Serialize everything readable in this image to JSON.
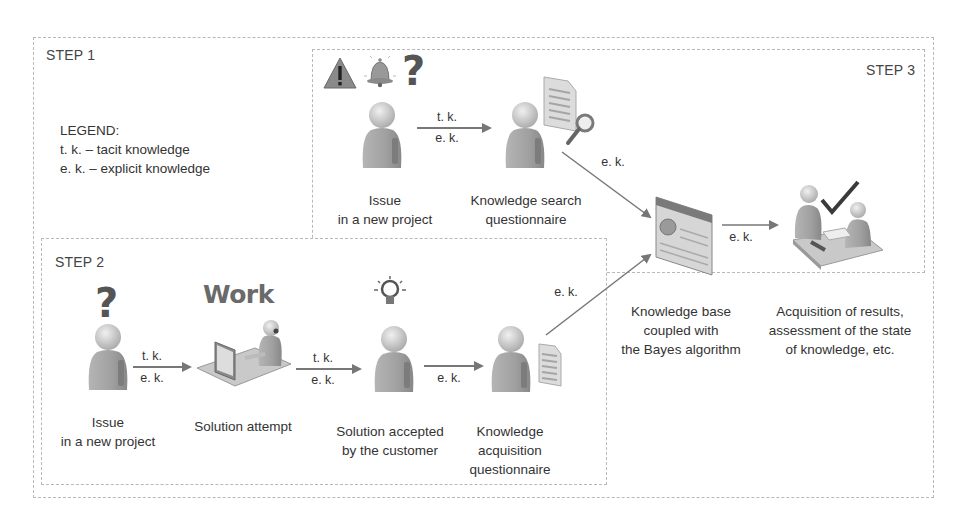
{
  "steps": {
    "step1": {
      "label": "STEP 1"
    },
    "step2": {
      "label": "STEP 2"
    },
    "step3": {
      "label": "STEP 3"
    }
  },
  "legend": {
    "title": "LEGEND:",
    "items": [
      "t. k. – tacit knowledge",
      "e. k. – explicit knowledge"
    ]
  },
  "step3_nodes": [
    {
      "id": "issue",
      "caption_lines": [
        "Issue",
        "in a new project"
      ],
      "icons": [
        "warning-icon",
        "bell-icon",
        "question-icon",
        "person-icon"
      ]
    },
    {
      "id": "search_questionnaire",
      "caption_lines": [
        "Knowledge search",
        "questionnaire"
      ],
      "icons": [
        "person-icon",
        "document-icon",
        "magnifier-icon"
      ]
    },
    {
      "id": "knowledge_base",
      "caption_lines": [
        "Knowledge base",
        "coupled with",
        "the Bayes algorithm"
      ],
      "icons": [
        "database-panel-icon"
      ]
    },
    {
      "id": "results",
      "caption_lines": [
        "Acquisition of results,",
        "assessment of the state",
        "of knowledge, etc."
      ],
      "icons": [
        "meeting-icon",
        "checkmark-icon"
      ]
    }
  ],
  "step2_nodes": [
    {
      "id": "issue2",
      "caption_lines": [
        "Issue",
        "in a new project"
      ],
      "icons": [
        "question-icon",
        "person-icon"
      ]
    },
    {
      "id": "solution_attempt",
      "caption_lines": [
        "Solution attempt"
      ],
      "heading": "Work",
      "icons": [
        "workstation-icon"
      ]
    },
    {
      "id": "solution_accepted",
      "caption_lines": [
        "Solution accepted",
        "by the customer"
      ],
      "icons": [
        "lightbulb-icon",
        "person-icon"
      ]
    },
    {
      "id": "acquisition_questionnaire",
      "caption_lines": [
        "Knowledge",
        "acquisition",
        "questionnaire"
      ],
      "icons": [
        "person-icon",
        "document-icon"
      ]
    }
  ],
  "flows": [
    {
      "from": "issue",
      "to": "search_questionnaire",
      "top": "t. k.",
      "bottom": "e. k."
    },
    {
      "from": "search_questionnaire",
      "to": "knowledge_base",
      "label": "e. k."
    },
    {
      "from": "knowledge_base",
      "to": "results",
      "label": "e. k."
    },
    {
      "from": "issue2",
      "to": "solution_attempt",
      "top": "t. k.",
      "bottom": "e. k."
    },
    {
      "from": "solution_attempt",
      "to": "solution_accepted",
      "top": "t. k.",
      "bottom": "e. k."
    },
    {
      "from": "solution_accepted",
      "to": "acquisition_questionnaire",
      "label": "e. k."
    },
    {
      "from": "acquisition_questionnaire",
      "to": "knowledge_base",
      "label": "e. k."
    }
  ],
  "colors": {
    "border": "#b8b8b8",
    "arrow": "#777777",
    "person_body": "#9a9a9a",
    "person_head": "#c8c8c8",
    "text": "#333333"
  }
}
